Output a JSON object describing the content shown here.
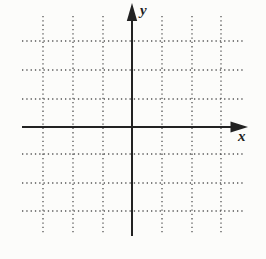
{
  "figure": {
    "x_label": "x",
    "y_label": "y",
    "colors": {
      "background": "#fcfcfa",
      "axis": "#222222",
      "grid": "#555555",
      "label": "#1f1f1f"
    },
    "grid": {
      "vertical_x": [
        43,
        73,
        103,
        162,
        192,
        221
      ],
      "vertical_y1": 16,
      "vertical_y2": 233,
      "horizontal_y": [
        41,
        70,
        99,
        154,
        183,
        211
      ],
      "horizontal_x1": 22,
      "horizontal_x2": 243,
      "dash": "1.3 3",
      "stroke_width": 1.3
    },
    "axes": {
      "x": {
        "y": 127,
        "x1": 22,
        "x2": 233,
        "stroke_width": 2,
        "arrow_points": "248,127 230.5,121.5 230.5,132.5"
      },
      "y": {
        "x": 132,
        "y1": 18,
        "y2": 236,
        "stroke_width": 2,
        "arrow_points": "132,3 126.8,21 137.2,21"
      }
    }
  }
}
